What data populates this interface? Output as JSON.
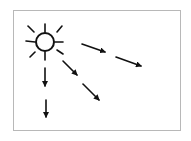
{
  "diagram": {
    "frame": {
      "x": 13,
      "y": 10,
      "width": 167,
      "height": 120,
      "stroke": "#b8b8b8"
    },
    "ink": "#111111",
    "sun": {
      "cx": 45,
      "cy": 42,
      "r": 9,
      "rays": [
        [
          45,
          24,
          45,
          32
        ],
        [
          45,
          52,
          45,
          60
        ],
        [
          26,
          41,
          35,
          42
        ],
        [
          55,
          42,
          63,
          42
        ],
        [
          28,
          26,
          34,
          32
        ],
        [
          62,
          26,
          57,
          32
        ],
        [
          30,
          57,
          35,
          52
        ],
        [
          57,
          50,
          63,
          54
        ]
      ]
    },
    "arrows": [
      {
        "name": "arrow-right-upper-1",
        "x1": 82,
        "y1": 44,
        "x2": 105,
        "y2": 52
      },
      {
        "name": "arrow-right-upper-2",
        "x1": 116,
        "y1": 57,
        "x2": 141,
        "y2": 66
      },
      {
        "name": "arrow-diagonal-1",
        "x1": 63,
        "y1": 61,
        "x2": 77,
        "y2": 75
      },
      {
        "name": "arrow-diagonal-2",
        "x1": 83,
        "y1": 84,
        "x2": 99,
        "y2": 100
      },
      {
        "name": "arrow-down-1",
        "x1": 45,
        "y1": 68,
        "x2": 45,
        "y2": 86
      },
      {
        "name": "arrow-down-2",
        "x1": 46,
        "y1": 100,
        "x2": 46,
        "y2": 117
      }
    ]
  }
}
